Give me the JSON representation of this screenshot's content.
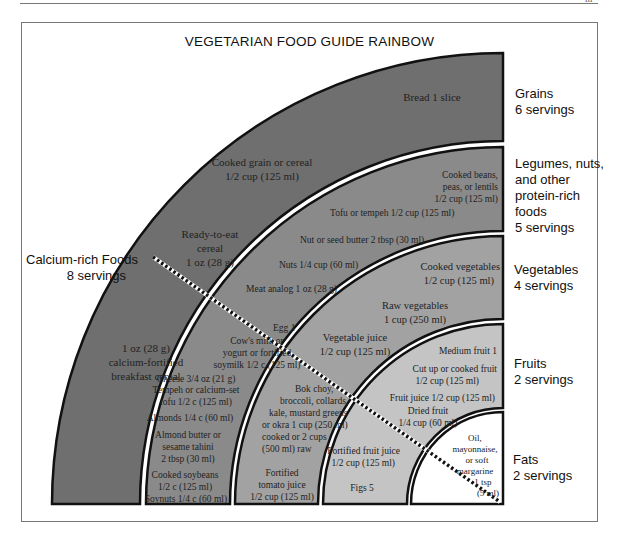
{
  "page_mark": "ııı",
  "title": "VEGETARIAN FOOD GUIDE RAINBOW",
  "colors": {
    "grains": "#6f6f6f",
    "legumes": "#8a8a8a",
    "vegetables": "#a2a2a2",
    "fruits": "#c4c4c4",
    "fats": "#ffffff",
    "outline": "#111111"
  },
  "groups": [
    {
      "name": "Grains",
      "servings": "6 servings",
      "items": [
        "Bread 1 slice",
        "Cooked grain or cereal",
        "1/2 cup (125 ml)",
        "Ready-to-eat",
        "cereal",
        "1 oz (28 g)",
        "1 oz (28 g)",
        "calcium-fortified",
        "breakfast cereal"
      ]
    },
    {
      "name": "Legumes, nuts,",
      "name2": "and other",
      "name3": "protein-rich",
      "name4": "foods",
      "servings": "5 servings",
      "items": [
        "Cooked beans,",
        "peas, or lentils",
        "1/2 cup (125 ml)",
        "Tofu or tempeh 1/2 cup (125 ml)",
        "Nut or seed butter 2 tbsp (30 ml)",
        "Nuts 1/4 cup (60 ml)",
        "Meat analog 1 oz (28 g)",
        "Egg 1",
        "Cow's milk or",
        "yogurt or fortified",
        "soymilk 1/2 c (125 ml)",
        "Cheese 3/4 oz (21 g)",
        "Tempeh or calcium-set",
        "tofu 1/2 c (125 ml)",
        "Almonds 1/4 c (60 ml)",
        "Almond butter or",
        "sesame tahini",
        "2 tbsp (30 ml)",
        "Cooked soybeans",
        "1/2 c (125 ml)",
        "Soynuts 1/4 c (60 ml)"
      ]
    },
    {
      "name": "Vegetables",
      "servings": "4 servings",
      "items": [
        "Cooked vegetables",
        "1/2 cup (125 ml)",
        "Raw vegetables",
        "1 cup (250 ml)",
        "Vegetable juice",
        "1/2 cup (125 ml)",
        "Bok choy,",
        "broccoli, collards,",
        "kale, mustard greens",
        "or okra 1 cup (250 ml)",
        "cooked or 2 cups",
        "(500 ml) raw",
        "Fortified",
        "tomato juice",
        "1/2 cup (125 ml)"
      ]
    },
    {
      "name": "Fruits",
      "servings": "2 servings",
      "items": [
        "Medium fruit 1",
        "Cut up or cooked fruit",
        "1/2 cup (125 ml)",
        "Fruit juice 1/2 cup (125 ml)",
        "Dried fruit",
        "1/4 cup (60 ml)",
        "Fortified fruit juice",
        "1/2 cup (125 ml)",
        "Figs 5"
      ]
    },
    {
      "name": "Fats",
      "servings": "2 servings",
      "items": [
        "Oil,",
        "mayonnaise,",
        "or soft",
        "margarine",
        "1 tsp",
        "(5 ml)"
      ]
    }
  ],
  "calcium": {
    "name": "Calcium-rich Foods",
    "servings": "8 servings"
  }
}
